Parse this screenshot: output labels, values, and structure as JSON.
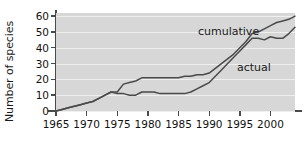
{
  "chart_data": {
    "type": "line",
    "title": "",
    "xlabel": "",
    "ylabel": "Number of species",
    "xlim": [
      1965,
      2004
    ],
    "ylim": [
      0,
      62
    ],
    "xticks": [
      1965,
      1970,
      1975,
      1980,
      1985,
      1990,
      1995,
      2000
    ],
    "yticks": [
      0,
      10,
      20,
      30,
      40,
      50,
      60
    ],
    "grid": "horizontal",
    "legend_position": "inline-annotations",
    "background_color": "#d7d7d7",
    "gridline_color": "#efefef",
    "line_color": "#4a4a4a",
    "axis_color": "#4a4a4a",
    "series": [
      {
        "name": "cumulative",
        "x": [
          1965,
          1966,
          1967,
          1968,
          1969,
          1970,
          1971,
          1972,
          1973,
          1974,
          1975,
          1976,
          1977,
          1978,
          1979,
          1980,
          1981,
          1982,
          1983,
          1984,
          1985,
          1986,
          1987,
          1988,
          1989,
          1990,
          1991,
          1992,
          1993,
          1994,
          1995,
          1996,
          1997,
          1998,
          1999,
          2000,
          2001,
          2002,
          2003,
          2004
        ],
        "values": [
          0,
          1,
          2,
          3,
          4,
          5,
          6,
          8,
          10,
          12,
          12,
          17,
          18,
          19,
          21,
          21,
          21,
          21,
          21,
          21,
          21,
          22,
          22,
          23,
          23,
          24,
          27,
          30,
          33,
          36,
          40,
          44,
          49,
          50,
          52,
          54,
          56,
          57,
          58,
          60
        ]
      },
      {
        "name": "actual",
        "x": [
          1965,
          1966,
          1967,
          1968,
          1969,
          1970,
          1971,
          1972,
          1973,
          1974,
          1975,
          1976,
          1977,
          1978,
          1979,
          1980,
          1981,
          1982,
          1983,
          1984,
          1985,
          1986,
          1987,
          1988,
          1989,
          1990,
          1991,
          1992,
          1993,
          1994,
          1995,
          1996,
          1997,
          1998,
          1999,
          2000,
          2001,
          2002,
          2003,
          2004
        ],
        "values": [
          0,
          1,
          2,
          3,
          4,
          5,
          6,
          8,
          10,
          12,
          11,
          11,
          10,
          10,
          12,
          12,
          12,
          11,
          11,
          11,
          11,
          11,
          12,
          14,
          16,
          18,
          22,
          26,
          30,
          34,
          38,
          42,
          46,
          46,
          45,
          47,
          46,
          46,
          49,
          53
        ]
      }
    ],
    "annotations": [
      {
        "text": "cumulative",
        "x": 1985.5,
        "y": 54
      },
      {
        "text": "actual",
        "x": 1991.5,
        "y": 35
      }
    ]
  }
}
